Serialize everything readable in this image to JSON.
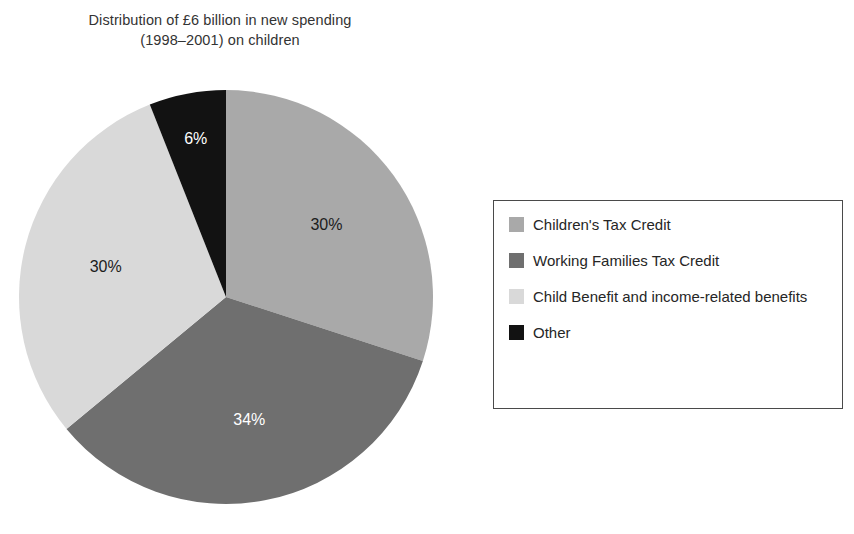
{
  "chart_data": {
    "type": "pie",
    "title": "Distribution of £6 billion in new spending (1998–2001) on children",
    "title_line1": "Distribution of £6 billion in new spending",
    "title_line2": "(1998–2001) on children",
    "categories": [
      "Children's Tax Credit",
      "Working Families Tax Credit",
      "Child Benefit and income-related benefits",
      "Other"
    ],
    "values": [
      30,
      34,
      30,
      6
    ],
    "value_labels": [
      "30%",
      "34%",
      "30%",
      "6%"
    ],
    "colors": [
      "#a9a9a9",
      "#6f6f6f",
      "#d9d9d9",
      "#121212"
    ],
    "label_colors": [
      "#1c1c1c",
      "#ffffff",
      "#1c1c1c",
      "#ffffff"
    ],
    "units": "percent",
    "start_angle_deg": 0,
    "direction": "clockwise",
    "legend_position": "right",
    "grid": false,
    "xlabel": "",
    "ylabel": ""
  },
  "legend": {
    "items": [
      {
        "label": "Children's Tax Credit",
        "color": "#a9a9a9"
      },
      {
        "label": "Working Families Tax Credit",
        "color": "#6f6f6f"
      },
      {
        "label": "Child Benefit and income-related benefits",
        "color": "#d9d9d9"
      },
      {
        "label": "Other",
        "color": "#121212"
      }
    ]
  }
}
